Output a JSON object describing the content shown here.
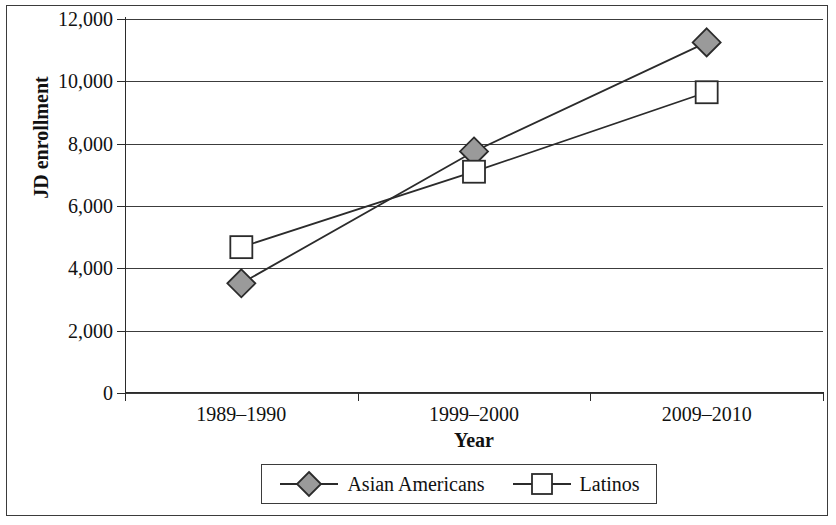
{
  "chart_data": {
    "type": "line",
    "title": "",
    "subtitle": "",
    "xlabel": "Year",
    "ylabel": "JD enrollment",
    "categories": [
      "1989–1990",
      "1999–2000",
      "2009–2010"
    ],
    "series": [
      {
        "name": "Asian Americans",
        "values": [
          3520,
          7750,
          11250
        ],
        "marker": "diamond",
        "marker_fill": "#9a9a9a",
        "marker_stroke": "#2b2b2b",
        "line_color": "#2b2b2b"
      },
      {
        "name": "Latinos",
        "values": [
          4680,
          7100,
          9650
        ],
        "marker": "square",
        "marker_fill": "#ffffff",
        "marker_stroke": "#2b2b2b",
        "line_color": "#2b2b2b"
      }
    ],
    "ylim": [
      0,
      12000
    ],
    "ytick_values": [
      0,
      2000,
      4000,
      6000,
      8000,
      10000,
      12000
    ],
    "ytick_labels": [
      "0",
      "2,000",
      "4,000",
      "6,000",
      "8,000",
      "10,000",
      "12,000"
    ],
    "grid": "horizontal",
    "legend_position": "bottom",
    "legend_entries": [
      "Asian Americans",
      "Latinos"
    ]
  },
  "axes": {
    "y_title": "JD enrollment",
    "x_title": "Year",
    "y_labels": [
      "12,000",
      "10,000",
      "8,000",
      "6,000",
      "4,000",
      "2,000",
      "0"
    ],
    "x_labels": [
      "1989–1990",
      "1999–2000",
      "2009–2010"
    ]
  },
  "legend": {
    "entries": [
      {
        "label": "Asian Americans",
        "marker": "diamond-marker"
      },
      {
        "label": "Latinos",
        "marker": "square-marker"
      }
    ]
  },
  "colors": {
    "axis": "#2b2b2b",
    "grid": "#3c3c3c",
    "asian_americans_fill": "#9a9a9a",
    "latinos_fill": "#ffffff",
    "frame": "#3b3b3b"
  }
}
